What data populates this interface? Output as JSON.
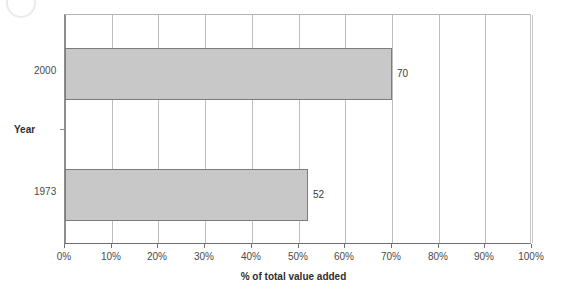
{
  "chart_data": {
    "type": "bar",
    "orientation": "horizontal",
    "title": "",
    "subtitle": "",
    "categories": [
      "1973",
      "2000"
    ],
    "values": [
      52,
      70
    ],
    "data_labels": [
      "52",
      "70"
    ],
    "series": [
      {
        "name": "% of total value added",
        "values": [
          52,
          70
        ]
      }
    ],
    "xlabel": "% of total value added",
    "ylabel": "Year",
    "xlim": [
      0,
      100
    ],
    "xtick_labels": [
      "0%",
      "10%",
      "20%",
      "30%",
      "40%",
      "50%",
      "60%",
      "70%",
      "80%",
      "90%",
      "100%"
    ],
    "xtick_values": [
      0,
      10,
      20,
      30,
      40,
      50,
      60,
      70,
      80,
      90,
      100
    ],
    "ytick_labels": [
      "2000",
      "1973"
    ],
    "grid": "vertical",
    "legend": "none",
    "bars": [
      {
        "category": "2000",
        "value": 70,
        "label": "70"
      },
      {
        "category": "1973",
        "value": 52,
        "label": "52"
      }
    ],
    "colors": {
      "bar_fill": "#c8c8c8",
      "bar_border": "#7c7c7c",
      "gridline": "#bdbdbd",
      "axis": "#6f6f6f",
      "text": "#3a3a3a",
      "background": "#ffffff"
    }
  },
  "axis": {
    "x_title": "% of total value added",
    "y_title": "Year"
  },
  "icons": {
    "scan_artifact": "circle-artifact-icon"
  }
}
